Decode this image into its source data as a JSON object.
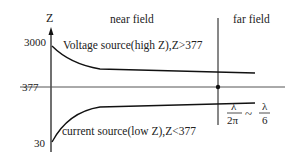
{
  "diagram": {
    "axis_label": "Z",
    "tick_top": "3000",
    "tick_mid": "377",
    "tick_bottom": "30",
    "region_near": "near field",
    "region_far": "far field",
    "upper_curve_label": "Voltage source(high Z),Z>377",
    "lower_curve_label": "current source(low Z),Z<377",
    "boundary": {
      "frac1_num": "λ",
      "frac1_den": "2π",
      "tilde": "~",
      "frac2_num": "λ",
      "frac2_den": "6"
    },
    "colors": {
      "line": "#111111",
      "ref_line": "#555555",
      "text": "#222222"
    }
  }
}
